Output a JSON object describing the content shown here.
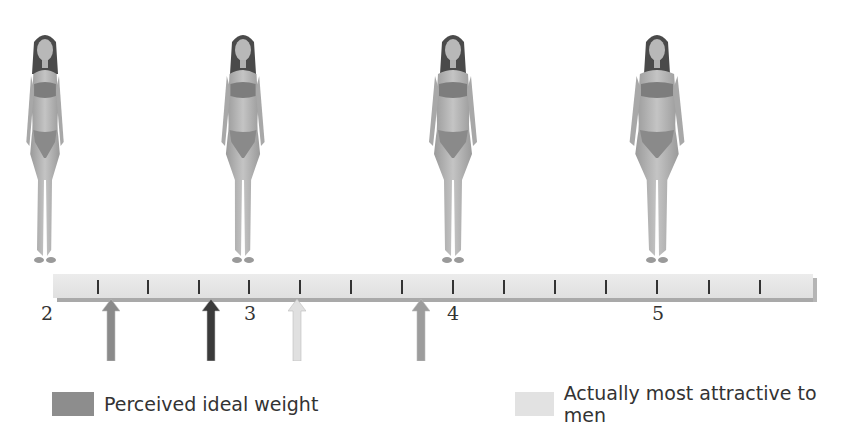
{
  "chart_data": {
    "type": "scale-with-markers",
    "title": "",
    "scale": {
      "min": 2,
      "max": 5.75,
      "tick_step": 0.25,
      "labels": [
        "2",
        "3",
        "4",
        "5"
      ]
    },
    "figures": [
      {
        "position": 2,
        "label": "thin body figure"
      },
      {
        "position": 3,
        "label": "slim body figure"
      },
      {
        "position": 4,
        "label": "average body figure"
      },
      {
        "position": 5,
        "label": "heavier body figure"
      }
    ],
    "markers": [
      {
        "value": 2.31,
        "series": "Perceived ideal weight",
        "color": "#8a8a8a"
      },
      {
        "value": 2.8,
        "series": "dark marker",
        "color": "#3a3a3a"
      },
      {
        "value": 3.22,
        "series": "Actually most attractive to men",
        "color": "#dedede"
      },
      {
        "value": 3.83,
        "series": "medium marker",
        "color": "#9a9a9a"
      }
    ],
    "legend": [
      {
        "label": "Perceived ideal weight",
        "color": "#8d8d8d"
      },
      {
        "label": "Actually most attractive to men",
        "color": "#e2e2e2"
      }
    ]
  },
  "scale": {
    "labels": [
      {
        "text": "2",
        "x": 47
      },
      {
        "text": "3",
        "x": 250
      },
      {
        "text": "4",
        "x": 453
      },
      {
        "text": "5",
        "x": 658
      }
    ],
    "ticks": [
      98,
      148,
      199,
      249,
      300,
      351,
      402,
      453,
      504,
      555,
      606,
      657,
      709,
      760
    ]
  },
  "arrows": [
    {
      "x": 111,
      "color": "#8a8a8a"
    },
    {
      "x": 211,
      "color": "#3a3a3a"
    },
    {
      "x": 297,
      "color": "#e0e0e0"
    },
    {
      "x": 421,
      "color": "#9c9c9c"
    }
  ],
  "figures": [
    {
      "x": 10,
      "width_scale": 0.78
    },
    {
      "x": 210,
      "width_scale": 0.9
    },
    {
      "x": 420,
      "width_scale": 1.0
    },
    {
      "x": 624,
      "width_scale": 1.14
    }
  ],
  "legend": {
    "perceived": {
      "label": "Perceived ideal weight",
      "color": "#8d8d8d"
    },
    "actual": {
      "label": "Actually most attractive to men",
      "color": "#e2e2e2"
    }
  }
}
